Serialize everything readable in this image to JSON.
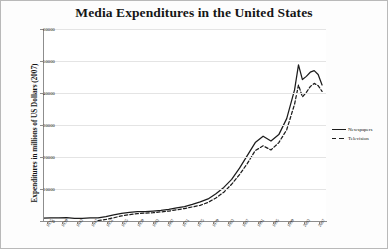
{
  "chart_data": {
    "type": "line",
    "title": "Media Expenditures in the United States",
    "xlabel": "",
    "ylabel": "Expenditures in millions of US Dollars (2007)",
    "ylim": [
      0,
      60000
    ],
    "xlim": [
      1935,
      2007
    ],
    "grid": true,
    "legend_position": "right",
    "yticks": [
      0,
      10000,
      20000,
      30000,
      40000,
      50000,
      60000
    ],
    "ytick_labels": [
      "0",
      "10000",
      "20000",
      "30000",
      "40000",
      "50000",
      "60000"
    ],
    "categories": [
      "1935",
      "1939",
      "1943",
      "1947",
      "1951",
      "1955",
      "1959",
      "1963",
      "1967",
      "1971",
      "1975",
      "1979",
      "1983",
      "1987",
      "1991",
      "1995",
      "1999",
      "2003",
      "2007"
    ],
    "xtick_labels": [
      "1935",
      "1939",
      "1943",
      "1947",
      "1951",
      "1955",
      "1959",
      "1963",
      "1967",
      "1971",
      "1975",
      "1979",
      "1983",
      "1987",
      "1991",
      "1995",
      "1999",
      "2003",
      "2007"
    ],
    "series": [
      {
        "name": "Newspapers",
        "style": "solid",
        "color": "#1c1c1c",
        "x": [
          1935,
          1937,
          1939,
          1941,
          1943,
          1945,
          1947,
          1949,
          1951,
          1953,
          1955,
          1957,
          1959,
          1961,
          1963,
          1965,
          1967,
          1969,
          1971,
          1973,
          1975,
          1977,
          1979,
          1981,
          1983,
          1985,
          1987,
          1989,
          1991,
          1993,
          1995,
          1997,
          1999,
          2000,
          2001,
          2002,
          2003,
          2004,
          2005,
          2006
        ],
        "y": [
          900,
          950,
          1000,
          1050,
          800,
          850,
          950,
          1000,
          1400,
          1900,
          2400,
          2700,
          2900,
          2950,
          3100,
          3300,
          3600,
          4100,
          4500,
          5200,
          6000,
          6900,
          8500,
          10500,
          13000,
          16500,
          20500,
          24500,
          26500,
          25000,
          27000,
          32000,
          41000,
          48800,
          44200,
          45200,
          46500,
          47000,
          45800,
          42500
        ]
      },
      {
        "name": "Television",
        "style": "dashed",
        "color": "#1c1c1c",
        "x": [
          1949,
          1951,
          1953,
          1955,
          1957,
          1959,
          1961,
          1963,
          1965,
          1967,
          1969,
          1971,
          1973,
          1975,
          1977,
          1979,
          1981,
          1983,
          1985,
          1987,
          1989,
          1991,
          1993,
          1995,
          1997,
          1999,
          2000,
          2001,
          2002,
          2003,
          2004,
          2005,
          2006
        ],
        "y": [
          150,
          500,
          1000,
          1600,
          2000,
          2300,
          2450,
          2600,
          2850,
          3100,
          3500,
          3900,
          4400,
          4900,
          5800,
          7200,
          9000,
          11500,
          14500,
          18000,
          22000,
          23500,
          22200,
          24500,
          28500,
          36500,
          42500,
          38800,
          40200,
          42000,
          43000,
          42300,
          40500
        ]
      }
    ]
  },
  "legend": {
    "items": [
      {
        "label": "Newspapers",
        "style": "solid"
      },
      {
        "label": "Television",
        "style": "dashed"
      }
    ]
  }
}
